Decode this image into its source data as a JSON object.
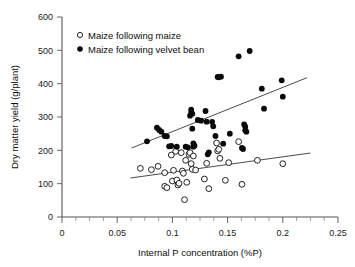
{
  "chart_data": {
    "type": "scatter",
    "title": "",
    "xlabel": "Internal P concentration (%P)",
    "ylabel": "Dry matter yield (g/plant)",
    "xlim": [
      0,
      0.25
    ],
    "ylim": [
      0,
      600
    ],
    "xticks": [
      0,
      0.05,
      0.1,
      0.15,
      0.2,
      0.25
    ],
    "xtick_labels": [
      "0",
      "0.05",
      "0.1",
      "0.15",
      "0.2",
      "0.25"
    ],
    "yticks": [
      0,
      100,
      200,
      300,
      400,
      500,
      600
    ],
    "ytick_labels": [
      "0",
      "100",
      "200",
      "300",
      "400",
      "500",
      "600"
    ],
    "xtick_minor_step": 0.0125,
    "grid": false,
    "legend_position": "top-left",
    "series": [
      {
        "name": "Maize following maize",
        "marker": "open-circle",
        "color": "#0a0a0a",
        "points": [
          [
            0.071,
            146
          ],
          [
            0.081,
            142
          ],
          [
            0.087,
            152
          ],
          [
            0.093,
            133
          ],
          [
            0.093,
            92
          ],
          [
            0.095,
            88
          ],
          [
            0.099,
            186
          ],
          [
            0.1,
            108
          ],
          [
            0.101,
            140
          ],
          [
            0.103,
            197
          ],
          [
            0.104,
            111
          ],
          [
            0.105,
            96
          ],
          [
            0.106,
            101
          ],
          [
            0.108,
            193
          ],
          [
            0.109,
            138
          ],
          [
            0.11,
            131
          ],
          [
            0.111,
            52
          ],
          [
            0.112,
            170
          ],
          [
            0.113,
            104
          ],
          [
            0.115,
            188
          ],
          [
            0.116,
            193
          ],
          [
            0.117,
            160
          ],
          [
            0.118,
            143
          ],
          [
            0.119,
            183
          ],
          [
            0.121,
            141
          ],
          [
            0.129,
            114
          ],
          [
            0.131,
            161
          ],
          [
            0.133,
            85
          ],
          [
            0.14,
            222
          ],
          [
            0.141,
            198
          ],
          [
            0.142,
            203
          ],
          [
            0.143,
            176
          ],
          [
            0.148,
            110
          ],
          [
            0.151,
            163
          ],
          [
            0.16,
            226
          ],
          [
            0.163,
            98
          ],
          [
            0.177,
            170
          ],
          [
            0.2,
            160
          ]
        ],
        "trend_line": {
          "x": [
            0.062,
            0.225
          ],
          "y": [
            117,
            192
          ]
        }
      },
      {
        "name": "Maize following velvet bean",
        "marker": "filled-circle",
        "color": "#0a0a0a",
        "points": [
          [
            0.077,
            227
          ],
          [
            0.086,
            268
          ],
          [
            0.088,
            261
          ],
          [
            0.09,
            256
          ],
          [
            0.093,
            243
          ],
          [
            0.095,
            242
          ],
          [
            0.097,
            212
          ],
          [
            0.099,
            213
          ],
          [
            0.104,
            211
          ],
          [
            0.112,
            211
          ],
          [
            0.114,
            209
          ],
          [
            0.116,
            304
          ],
          [
            0.117,
            313
          ],
          [
            0.117,
            322
          ],
          [
            0.118,
            310
          ],
          [
            0.118,
            265
          ],
          [
            0.119,
            221
          ],
          [
            0.119,
            211
          ],
          [
            0.12,
            214
          ],
          [
            0.123,
            291
          ],
          [
            0.126,
            289
          ],
          [
            0.13,
            318
          ],
          [
            0.131,
            286
          ],
          [
            0.132,
            188
          ],
          [
            0.133,
            194
          ],
          [
            0.136,
            285
          ],
          [
            0.137,
            272
          ],
          [
            0.139,
            243
          ],
          [
            0.141,
            420
          ],
          [
            0.142,
            419
          ],
          [
            0.144,
            421
          ],
          [
            0.146,
            220
          ],
          [
            0.152,
            250
          ],
          [
            0.16,
            482
          ],
          [
            0.163,
            207
          ],
          [
            0.164,
            204
          ],
          [
            0.165,
            278
          ],
          [
            0.166,
            271
          ],
          [
            0.166,
            260
          ],
          [
            0.167,
            256
          ],
          [
            0.17,
            498
          ],
          [
            0.181,
            385
          ],
          [
            0.183,
            325
          ],
          [
            0.199,
            410
          ],
          [
            0.2,
            361
          ]
        ],
        "trend_line": {
          "x": [
            0.063,
            0.222
          ],
          "y": [
            207,
            418
          ]
        }
      }
    ]
  },
  "legend": {
    "items": [
      {
        "label": "Maize following maize",
        "marker": "open-circle"
      },
      {
        "label": "Maize following velvet bean",
        "marker": "filled-circle"
      }
    ]
  }
}
